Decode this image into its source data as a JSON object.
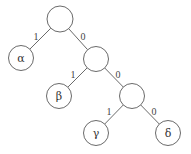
{
  "diagram": {
    "type": "binary-code-tree",
    "colors": {
      "stroke": "#6a6a6a",
      "node_fill": "#ffffff",
      "text": "#333333"
    },
    "nodes": [
      {
        "id": "root",
        "label": "",
        "cx": 60,
        "cy": 19,
        "r": 13
      },
      {
        "id": "alpha",
        "label": "α",
        "cx": 21,
        "cy": 58,
        "r": 12.5
      },
      {
        "id": "n1",
        "label": "",
        "cx": 96,
        "cy": 59,
        "r": 12.5
      },
      {
        "id": "beta",
        "label": "β",
        "cx": 59,
        "cy": 96,
        "r": 12.5
      },
      {
        "id": "n2",
        "label": "",
        "cx": 132,
        "cy": 96,
        "r": 12.5
      },
      {
        "id": "gamma",
        "label": "γ",
        "cx": 96,
        "cy": 133,
        "r": 12.5
      },
      {
        "id": "delta",
        "label": "δ",
        "cx": 168,
        "cy": 133,
        "r": 12.5
      }
    ],
    "edges": [
      {
        "from": "root",
        "to": "alpha",
        "label": "1",
        "lx": 36,
        "ly": 36
      },
      {
        "from": "root",
        "to": "n1",
        "label": "0",
        "lx": 83,
        "ly": 36
      },
      {
        "from": "n1",
        "to": "beta",
        "label": "1",
        "lx": 73,
        "ly": 74
      },
      {
        "from": "n1",
        "to": "n2",
        "label": "0",
        "lx": 118,
        "ly": 74
      },
      {
        "from": "n2",
        "to": "gamma",
        "label": "1",
        "lx": 109,
        "ly": 111
      },
      {
        "from": "n2",
        "to": "delta",
        "label": "0",
        "lx": 154,
        "ly": 111
      }
    ]
  }
}
